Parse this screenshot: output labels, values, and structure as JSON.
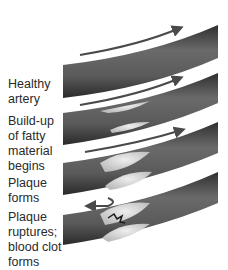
{
  "diagram": {
    "type": "atherosclerosis-progression",
    "stages": [
      {
        "id": "healthy",
        "lines": [
          "Healthy",
          "artery"
        ]
      },
      {
        "id": "buildup",
        "lines": [
          "Build-up",
          "of fatty",
          "material",
          "begins"
        ]
      },
      {
        "id": "plaque",
        "lines": [
          "Plaque",
          "forms"
        ]
      },
      {
        "id": "rupture",
        "lines": [
          "Plaque",
          "ruptures;",
          "blood clot",
          "forms"
        ]
      }
    ],
    "colors": {
      "artery_wall": "#5a5a5a",
      "artery_dark": "#3a3a3a",
      "plaque": "#d9d9d9",
      "arrow": "#555555",
      "background": "#ffffff"
    }
  }
}
